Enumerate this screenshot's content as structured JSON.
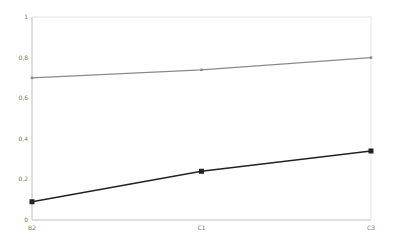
{
  "chart_data": {
    "type": "line",
    "title": "",
    "xlabel": "",
    "ylabel": "",
    "categories": [
      "B2",
      "C1",
      "C3"
    ],
    "ylim": [
      0,
      1
    ],
    "yticks": [
      0,
      0.2,
      0.4,
      0.6,
      0.8,
      1
    ],
    "ytick_labels": [
      "0",
      "0,2",
      "0,4",
      "0,6",
      "0,8",
      "1"
    ],
    "grid": false,
    "legend": null,
    "series": [
      {
        "name": "Series 1",
        "values": [
          0.7,
          0.74,
          0.8
        ],
        "color": "#8a8a8a",
        "marker": "small-square",
        "line_width": 1.2
      },
      {
        "name": "Series 2",
        "values": [
          0.09,
          0.24,
          0.34
        ],
        "color": "#222222",
        "marker": "square",
        "line_width": 1.4
      }
    ]
  },
  "layout": {
    "plot": {
      "left": 32,
      "top": 17,
      "right": 371,
      "bottom": 220
    },
    "axis_color": "#cccccc",
    "frame_color": "#e4e4e4"
  }
}
